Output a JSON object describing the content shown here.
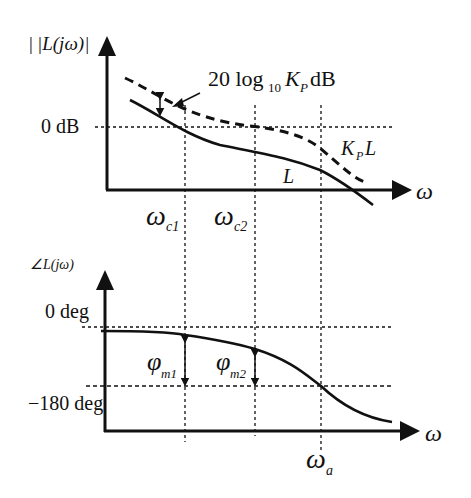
{
  "diagram": {
    "magnitude_plot": {
      "y_axis_label": "|L(jω)|",
      "x_axis_label": "ω",
      "reference_line_label": "0 dB",
      "gain_offset_label_main": "20 log",
      "gain_offset_label_sub": "10",
      "gain_offset_label_k": "K",
      "gain_offset_label_ksub": "P",
      "gain_offset_label_unit": "dB",
      "curves": [
        {
          "name": "L",
          "label": "L",
          "style": "solid"
        },
        {
          "name": "KpL",
          "label_k": "K",
          "label_sub": "P",
          "label_l": "L",
          "style": "dashed"
        }
      ]
    },
    "frequency_markers": [
      {
        "id": "wc1",
        "symbol": "ω",
        "subscript": "c1"
      },
      {
        "id": "wc2",
        "symbol": "ω",
        "subscript": "c2"
      },
      {
        "id": "wa",
        "symbol": "ω",
        "subscript": "a"
      }
    ],
    "phase_plot": {
      "y_axis_label": "∠L(jω)",
      "x_axis_label": "ω",
      "upper_reference_label": "0 deg",
      "lower_reference_label": "−180 deg",
      "phase_margins": [
        {
          "symbol": "φ",
          "subscript": "m1"
        },
        {
          "symbol": "φ",
          "subscript": "m2"
        }
      ]
    }
  },
  "colors": {
    "ink": "#111111",
    "background": "#ffffff"
  }
}
